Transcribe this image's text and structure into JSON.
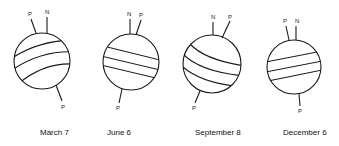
{
  "figure": {
    "panels": [
      {
        "date": "March 7",
        "pole_top_left": "P",
        "pole_top_right": "N",
        "pole_bottom": "P"
      },
      {
        "date": "June 6",
        "pole_top_left": "N",
        "pole_top_right": "P",
        "pole_bottom": "P"
      },
      {
        "date": "September 8",
        "pole_top_left": "N",
        "pole_top_right": "P",
        "pole_bottom": "P"
      },
      {
        "date": "December 6",
        "pole_top_left": "P",
        "pole_top_right": "N",
        "pole_bottom": "P"
      }
    ]
  }
}
